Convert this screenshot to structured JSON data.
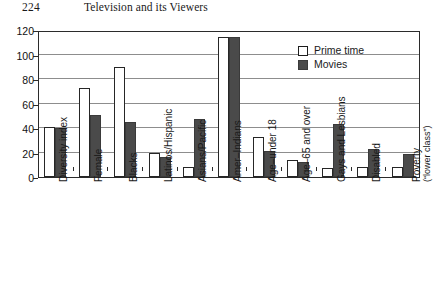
{
  "header": {
    "page_number": "224",
    "title": "Television and its Viewers"
  },
  "chart_data": {
    "type": "bar",
    "title": "",
    "xlabel": "",
    "ylabel": "",
    "ylim": [
      0,
      120
    ],
    "yticks": [
      0,
      20,
      40,
      60,
      80,
      100,
      120
    ],
    "ytick_labels": [
      "0",
      "20",
      "40",
      "60",
      "80",
      "100",
      "120"
    ],
    "grid": true,
    "legend_position": "top-right",
    "categories": [
      "Diversity index",
      "Female",
      "Blacks",
      "Latinos/Hispanic",
      "Asians/Pacific",
      "Amer–Indians",
      "Age–under 18",
      "Age–65 and over",
      "Gays and Lesbians",
      "Disabled",
      "Poverty"
    ],
    "category_sublabels": [
      "",
      "",
      "",
      "",
      "",
      "",
      "",
      "",
      "",
      "",
      "(“lower class”)"
    ],
    "series": [
      {
        "name": "Prime time",
        "color": "#ffffff",
        "values": [
          41,
          73,
          90,
          20,
          8,
          114,
          33,
          14,
          7,
          8,
          8
        ]
      },
      {
        "name": "Movies",
        "color": "#4a4a4a",
        "values": [
          40,
          51,
          45,
          16,
          47,
          114,
          21,
          12,
          43,
          23,
          19
        ]
      }
    ]
  }
}
